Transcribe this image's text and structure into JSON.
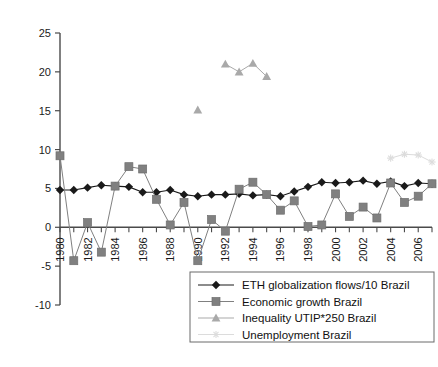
{
  "chart_data": {
    "type": "line",
    "title": "",
    "xlabel": "",
    "ylabel": "",
    "xlim": [
      1980,
      2007
    ],
    "ylim": [
      -10,
      25
    ],
    "yticks": [
      25,
      20,
      15,
      10,
      5,
      0,
      -5,
      -10
    ],
    "ytick_labels": [
      "25",
      "20",
      "15",
      "10",
      "5",
      "0",
      "-5",
      "-10"
    ],
    "xticks": [
      1980,
      1982,
      1984,
      1986,
      1988,
      1990,
      1992,
      1994,
      1996,
      1998,
      2000,
      2002,
      2004,
      2006
    ],
    "xtick_labels": [
      "1980",
      "1982",
      "1984",
      "1986",
      "1988",
      "1990",
      "1992",
      "1994",
      "1996",
      "1998",
      "2000",
      "2002",
      "2004",
      "2006"
    ],
    "x": [
      1980,
      1981,
      1982,
      1983,
      1984,
      1985,
      1986,
      1987,
      1988,
      1989,
      1990,
      1991,
      1992,
      1993,
      1994,
      1995,
      1996,
      1997,
      1998,
      1999,
      2000,
      2001,
      2002,
      2003,
      2004,
      2005,
      2006,
      2007
    ],
    "grid": false,
    "legend_position": "bottom-right",
    "series": [
      {
        "name": "ETH globalization flows/10 Brazil",
        "marker": "diamond",
        "color": "#1a1a1a",
        "values": [
          4.8,
          4.8,
          5.1,
          5.4,
          5.3,
          5.2,
          4.5,
          4.5,
          4.8,
          4.2,
          4.0,
          4.2,
          4.2,
          4.3,
          4.1,
          4.2,
          4.0,
          4.6,
          5.2,
          5.8,
          5.7,
          5.8,
          6.0,
          5.6,
          5.9,
          5.3,
          5.7,
          5.6
        ]
      },
      {
        "name": "Economic growth Brazil",
        "marker": "square",
        "color": "#808080",
        "values": [
          9.2,
          -4.3,
          0.6,
          -3.2,
          5.3,
          7.8,
          7.5,
          3.6,
          0.3,
          3.2,
          -4.3,
          1.0,
          -0.5,
          4.9,
          5.8,
          4.2,
          2.2,
          3.4,
          0.1,
          0.3,
          4.3,
          1.4,
          2.6,
          1.2,
          5.7,
          3.2,
          4.0,
          5.6
        ]
      },
      {
        "name": "Inequality UTIP*250 Brazil",
        "marker": "triangle",
        "color": "#a9a9a9",
        "values": [
          null,
          null,
          null,
          null,
          null,
          null,
          null,
          null,
          null,
          null,
          15.1,
          null,
          21.0,
          20.0,
          21.1,
          19.4,
          null,
          null,
          null,
          null,
          null,
          null,
          null,
          null,
          null,
          null,
          null,
          null
        ]
      },
      {
        "name": "Unemployment Brazil",
        "marker": "star",
        "color": "#dcdcdc",
        "values": [
          null,
          null,
          null,
          null,
          null,
          null,
          null,
          null,
          null,
          null,
          null,
          null,
          null,
          null,
          null,
          null,
          null,
          null,
          null,
          null,
          null,
          null,
          null,
          null,
          8.9,
          9.4,
          9.3,
          8.4
        ]
      }
    ],
    "legend": [
      {
        "label": "ETH globalization flows/10 Brazil",
        "marker": "diamond",
        "color": "#1a1a1a"
      },
      {
        "label": "Economic growth Brazil",
        "marker": "square",
        "color": "#808080"
      },
      {
        "label": "Inequality UTIP*250 Brazil",
        "marker": "triangle",
        "color": "#a9a9a9"
      },
      {
        "label": "Unemployment Brazil",
        "marker": "star",
        "color": "#dcdcdc"
      }
    ]
  }
}
